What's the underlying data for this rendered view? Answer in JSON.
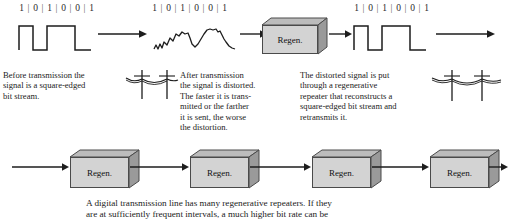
{
  "diagram": {
    "bit_stream": [
      "1",
      "0",
      "1",
      "0",
      "0",
      "1"
    ],
    "bit_separator": "|",
    "stages": [
      {
        "id": "stage-source",
        "bits_label": "1 | 0 | 1 | 0 | 0 | 1",
        "signal_type": "square-wave",
        "caption": "Before transmission the signal is a square-edged bit stream."
      },
      {
        "id": "stage-distorted",
        "bits_label": "1 | 0 | 1 | 0 | 0 | 1",
        "signal_type": "distorted-wave",
        "caption": "After transmission the signal is distorted. The faster it is transmitted or the farther it is sent, the worse the distortion."
      },
      {
        "id": "stage-regenerated",
        "bits_label": "1 | 0 | 1 | 0 | 0 | 1",
        "signal_type": "square-wave",
        "caption": "The distorted signal is put through a regenerative repeater that reconstructs a square-edged bit stream and retransmits it."
      }
    ],
    "text_blocks": [
      {
        "name": "before-transmission-text",
        "lines": [
          "Before transmission the",
          "signal is a square-edged",
          "bit stream."
        ]
      },
      {
        "name": "after-transmission-text",
        "lines": [
          "After transmission",
          "the signal is distorted.",
          "The faster it is trans-",
          "mitted or the farther",
          "it is sent, the worse",
          "the distortion."
        ]
      },
      {
        "name": "regenerative-repeater-text",
        "lines": [
          "The distorted signal is put",
          "through a regenerative",
          "repeater that reconstructs a",
          "square-edged bit stream and",
          "retransmits it."
        ]
      }
    ],
    "repeater_label": "Regen.",
    "repeaters": [
      {
        "label": "Regen."
      },
      {
        "label": "Regen."
      },
      {
        "label": "Regen."
      },
      {
        "label": "Regen."
      }
    ],
    "top_repeater": {
      "label": "Regen."
    },
    "bottom_caption": {
      "lines": [
        "A digital transmission line has many regenerative repeaters. If they",
        "are at sufficiently frequent intervals, a much higher bit rate can be"
      ]
    },
    "pole_icons": [
      {
        "name": "telephone-pole-pair-left"
      },
      {
        "name": "telephone-pole-pair-right"
      }
    ],
    "colors": {
      "line": "#1d1d1d",
      "box_front": "#d3d3d3",
      "box_top": "#bcbcbc",
      "box_side": "#9a9a9a",
      "text": "#1b1b1b",
      "background": "#ffffff"
    }
  }
}
